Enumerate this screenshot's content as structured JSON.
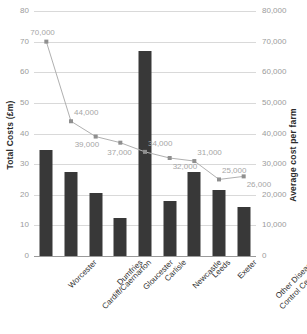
{
  "chart_data": {
    "type": "bar",
    "title": "",
    "categories": [
      "Worcester",
      "Cardiff/Caernarfon",
      "Dumfries",
      "Gloucester",
      "Carlisle",
      "Newcastle",
      "Leeds",
      "Exeter",
      "Other Disease Control Centres"
    ],
    "series": [
      {
        "name": "Total Costs (£m)",
        "type": "bar",
        "axis": "left",
        "color": "#383838",
        "values": [
          34.5,
          27.5,
          20.5,
          12.5,
          67,
          18,
          27.5,
          21.5,
          16
        ]
      },
      {
        "name": "Average cost per farm",
        "type": "line",
        "axis": "right",
        "color": "#b0b0b0",
        "values": [
          70000,
          44000,
          39000,
          37000,
          34000,
          32000,
          31000,
          25000,
          26000
        ],
        "data_labels": [
          "70,000",
          "44,000",
          "39,000",
          "37,000",
          "34,000",
          "32,000",
          "31,000",
          "25,000",
          "26,000"
        ]
      }
    ],
    "xlabel": "",
    "ylabel": "Total Costs (£m)",
    "y2label": "Average cost per farm",
    "ylim": [
      0,
      80
    ],
    "y2lim": [
      0,
      80000
    ],
    "yticks": [
      "0",
      "10",
      "20",
      "30",
      "40",
      "50",
      "60",
      "70",
      "80"
    ],
    "y2ticks": [
      "0",
      "10,000",
      "20,000",
      "30,000",
      "40,000",
      "50,000",
      "60,000",
      "70,000",
      "80,000"
    ],
    "grid": true,
    "legend": "none"
  },
  "axes": {
    "left_title": "Total Costs (£m)",
    "right_title": "Average cost per farm"
  }
}
